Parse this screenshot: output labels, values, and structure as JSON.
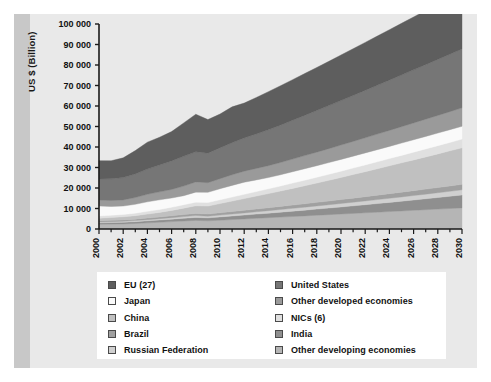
{
  "chart_data": {
    "type": "area",
    "stacked": true,
    "title": "",
    "xlabel": "",
    "ylabel": "US $ (Billion)",
    "ylim": [
      0,
      100000
    ],
    "xlim": [
      2000,
      2030
    ],
    "grid": false,
    "legend_position": "bottom",
    "y_ticks": [
      "0",
      "10 000",
      "20 000",
      "30 000",
      "40 000",
      "50 000",
      "60 000",
      "70 000",
      "80 000",
      "90 000",
      "100 000"
    ],
    "y_tick_values": [
      0,
      10000,
      20000,
      30000,
      40000,
      50000,
      60000,
      70000,
      80000,
      90000,
      100000
    ],
    "x_ticks": [
      "2000",
      "2002",
      "2004",
      "2006",
      "2008",
      "2010",
      "2012",
      "2014",
      "2016",
      "2018",
      "2020",
      "2022",
      "2024",
      "2026",
      "2028",
      "2030"
    ],
    "x_tick_values": [
      2000,
      2002,
      2004,
      2006,
      2008,
      2010,
      2012,
      2014,
      2016,
      2018,
      2020,
      2022,
      2024,
      2026,
      2028,
      2030
    ],
    "x": [
      2000,
      2001,
      2002,
      2003,
      2004,
      2005,
      2006,
      2007,
      2008,
      2009,
      2010,
      2011,
      2012,
      2013,
      2014,
      2015,
      2016,
      2017,
      2018,
      2019,
      2020,
      2021,
      2022,
      2023,
      2024,
      2025,
      2026,
      2027,
      2028,
      2029,
      2030
    ],
    "series": [
      {
        "name": "Other developing economies",
        "color": "#b5b5b5",
        "values": [
          2300,
          2400,
          2500,
          2700,
          3000,
          3300,
          3600,
          3900,
          4200,
          4000,
          4300,
          4600,
          4900,
          5200,
          5500,
          5800,
          6100,
          6400,
          6700,
          7000,
          7300,
          7600,
          7900,
          8200,
          8500,
          8800,
          9100,
          9400,
          9700,
          10000,
          10300
        ]
      },
      {
        "name": "India",
        "color": "#8f8f8f",
        "values": [
          700,
          750,
          800,
          880,
          980,
          1080,
          1200,
          1330,
          1450,
          1450,
          1600,
          1750,
          1900,
          2060,
          2230,
          2410,
          2600,
          2800,
          3010,
          3230,
          3460,
          3700,
          3950,
          4210,
          4480,
          4760,
          5050,
          5350,
          5660,
          5980,
          6300
        ]
      },
      {
        "name": "Russian Federation",
        "color": "#d0d0d0",
        "values": [
          400,
          430,
          470,
          520,
          580,
          650,
          730,
          820,
          900,
          820,
          900,
          980,
          1060,
          1140,
          1220,
          1300,
          1380,
          1460,
          1540,
          1620,
          1700,
          1780,
          1860,
          1940,
          2020,
          2100,
          2180,
          2260,
          2340,
          2420,
          2500
        ]
      },
      {
        "name": "Brazil",
        "color": "#a0a0a0",
        "values": [
          650,
          660,
          680,
          710,
          760,
          820,
          890,
          970,
          1050,
          1010,
          1100,
          1180,
          1260,
          1340,
          1420,
          1500,
          1580,
          1660,
          1740,
          1820,
          1900,
          1980,
          2060,
          2140,
          2220,
          2300,
          2380,
          2460,
          2540,
          2620,
          2700
        ]
      },
      {
        "name": "China",
        "color": "#c0c0c0",
        "values": [
          1200,
          1350,
          1500,
          1700,
          1950,
          2250,
          2650,
          3150,
          3700,
          3900,
          4500,
          5100,
          5700,
          6300,
          6900,
          7500,
          8150,
          8800,
          9450,
          10100,
          10800,
          11500,
          12200,
          12900,
          13600,
          14300,
          15000,
          15700,
          16400,
          17100,
          17800
        ]
      },
      {
        "name": "NICs (6)",
        "color": "#e0e0e0",
        "values": [
          1100,
          1100,
          1150,
          1230,
          1330,
          1430,
          1540,
          1670,
          1780,
          1700,
          1850,
          1970,
          2090,
          2210,
          2330,
          2450,
          2570,
          2690,
          2810,
          2930,
          3050,
          3170,
          3290,
          3410,
          3530,
          3650,
          3770,
          3890,
          4010,
          4130,
          4250
        ]
      },
      {
        "name": "Japan",
        "color": "#fafafa",
        "values": [
          4900,
          4300,
          4100,
          4300,
          4650,
          4700,
          4500,
          4400,
          4900,
          5000,
          5400,
          5700,
          5900,
          5700,
          5500,
          5500,
          5550,
          5600,
          5650,
          5700,
          5750,
          5800,
          5850,
          5900,
          5950,
          6000,
          6050,
          6100,
          6150,
          6200,
          6250
        ]
      },
      {
        "name": "Other developed economies",
        "color": "#9a9a9a",
        "values": [
          2900,
          2900,
          3000,
          3300,
          3700,
          3900,
          4200,
          4700,
          5000,
          4700,
          4900,
          5200,
          5400,
          5600,
          5800,
          6000,
          6200,
          6400,
          6600,
          6800,
          7000,
          7200,
          7400,
          7600,
          7800,
          8000,
          8200,
          8400,
          8600,
          8800,
          9000
        ]
      },
      {
        "name": "United States",
        "color": "#767676",
        "values": [
          10300,
          10600,
          10900,
          11500,
          12300,
          13100,
          13900,
          14500,
          14700,
          14400,
          15000,
          15600,
          16200,
          16800,
          17500,
          18200,
          18900,
          19600,
          20300,
          21000,
          21700,
          22400,
          23100,
          23800,
          24500,
          25200,
          25900,
          26600,
          27300,
          28000,
          28700
        ]
      },
      {
        "name": "EU (27)",
        "color": "#5e5e5e",
        "values": [
          8900,
          8800,
          9600,
          11400,
          13100,
          13500,
          14300,
          16300,
          18300,
          16400,
          16500,
          17500,
          17000,
          17800,
          18600,
          19200,
          19800,
          20400,
          21000,
          21600,
          22200,
          22800,
          23400,
          24000,
          24600,
          25200,
          25800,
          26400,
          27000,
          27600,
          28200
        ]
      }
    ]
  },
  "legend": {
    "column1": [
      {
        "label": "EU (27)",
        "color": "#5e5e5e"
      },
      {
        "label": "Japan",
        "color": "#fafafa"
      },
      {
        "label": "China",
        "color": "#c0c0c0"
      },
      {
        "label": "Brazil",
        "color": "#a0a0a0"
      },
      {
        "label": "Russian Federation",
        "color": "#d0d0d0"
      }
    ],
    "column2": [
      {
        "label": "United States",
        "color": "#767676"
      },
      {
        "label": "Other developed economies",
        "color": "#9a9a9a"
      },
      {
        "label": "NICs (6)",
        "color": "#e0e0e0"
      },
      {
        "label": "India",
        "color": "#8f8f8f"
      },
      {
        "label": "Other developing economies",
        "color": "#b5b5b5"
      }
    ]
  },
  "colors": {
    "page_background": "#e9e9e9",
    "gutter": "#c8c8c8",
    "legend_background": "#ffffff",
    "axis": "#1a1a1a",
    "text": "#111111"
  }
}
